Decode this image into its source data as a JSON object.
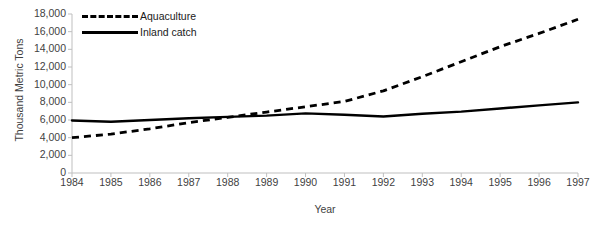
{
  "chart_data": {
    "type": "line",
    "title": "",
    "xlabel": "Year",
    "ylabel": "Thousand Metric Tons",
    "x": [
      1984,
      1985,
      1986,
      1987,
      1988,
      1989,
      1990,
      1991,
      1992,
      1993,
      1994,
      1995,
      1996,
      1997
    ],
    "categories": [
      "1984",
      "1985",
      "1986",
      "1987",
      "1988",
      "1989",
      "1990",
      "1991",
      "1992",
      "1993",
      "1994",
      "1995",
      "1996",
      "1997"
    ],
    "xlim": [
      1984,
      1997
    ],
    "ylim": [
      0,
      18000
    ],
    "yticks": [
      0,
      2000,
      4000,
      6000,
      8000,
      10000,
      12000,
      14000,
      16000,
      18000
    ],
    "ytick_labels": [
      "0",
      "2,000",
      "4,000",
      "6,000",
      "8,000",
      "10,000",
      "12,000",
      "14,000",
      "16,000",
      "18,000"
    ],
    "grid": false,
    "legend_position": "top-left",
    "series": [
      {
        "name": "Aquaculture",
        "style": "dashed",
        "color": "#000000",
        "values": [
          4000,
          4400,
          5000,
          5700,
          6300,
          6900,
          7500,
          8100,
          9300,
          10900,
          12600,
          14300,
          15800,
          17400
        ]
      },
      {
        "name": "Inland catch",
        "style": "solid",
        "color": "#000000",
        "values": [
          5950,
          5800,
          6000,
          6200,
          6350,
          6500,
          6750,
          6600,
          6400,
          6700,
          6950,
          7300,
          7650,
          8000
        ]
      }
    ]
  },
  "axis": {
    "y_title": "Thousand Metric Tons",
    "x_title": "Year"
  },
  "legend": {
    "items": [
      {
        "label": "Aquaculture",
        "style": "dashed"
      },
      {
        "label": "Inland catch",
        "style": "solid"
      }
    ]
  },
  "colors": {
    "series": "#000000",
    "axis": "#bfbfbf",
    "text": "#3f3f3f"
  }
}
